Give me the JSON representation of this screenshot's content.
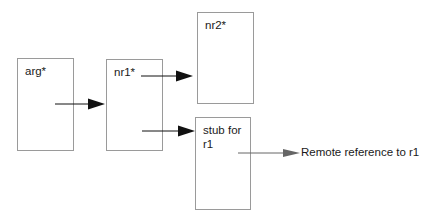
{
  "diagram": {
    "boxes": [
      {
        "id": "arg",
        "label": "arg*"
      },
      {
        "id": "nr1",
        "label": "nr1*"
      },
      {
        "id": "nr2",
        "label": "nr2*"
      },
      {
        "id": "stub",
        "label": "stub for\nr1"
      }
    ],
    "arrows": [
      {
        "from": "arg",
        "to": "nr1"
      },
      {
        "from": "nr1",
        "to": "nr2"
      },
      {
        "from": "nr1",
        "to": "stub"
      },
      {
        "from": "stub",
        "to": "remote-reference"
      }
    ],
    "remote_label": "Remote reference to r1",
    "colors": {
      "box_border": "#9a9a9a",
      "arrow": "#111111",
      "remote_arrow": "#666666"
    }
  }
}
